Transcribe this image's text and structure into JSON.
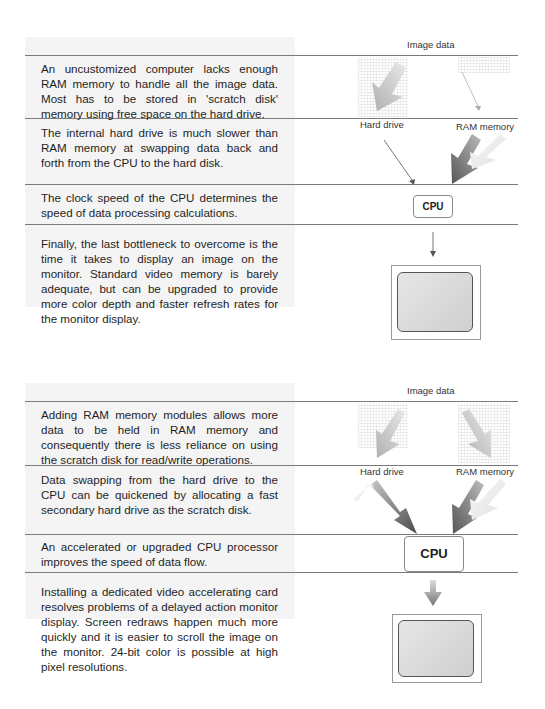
{
  "diagram_top": {
    "labels": {
      "image_data": "Image data",
      "hard_drive": "Hard drive",
      "ram_memory": "RAM memory",
      "cpu": "CPU"
    },
    "paragraphs": [
      "An uncustomized computer lacks enough RAM memory to handle all the image data. Most has to be stored in 'scratch disk' memory using free space on the hard drive.",
      "The internal hard drive is much slower than RAM memory at swapping data back and forth from the CPU to the hard disk.",
      "The clock speed of the CPU determines the speed of data processing calculations.",
      "Finally, the last bottleneck to overcome is the time it takes to display an image on the monitor. Standard video memory is barely adequate, but can be upgraded to provide more color depth and faster refresh rates for the monitor display."
    ]
  },
  "diagram_bottom": {
    "labels": {
      "image_data": "Image data",
      "hard_drive": "Hard drive",
      "ram_memory": "RAM memory",
      "cpu": "CPU"
    },
    "paragraphs": [
      "Adding RAM memory modules allows more data to be held in RAM memory and consequently there is less reliance on using the scratch disk for read/write operations.",
      "Data swapping from the hard drive to the CPU can be quickened by allocating a fast secondary hard drive as the scratch disk.",
      "An accelerated or upgraded CPU processor improves the speed of data flow.",
      "Installing a dedicated video accelerating card resolves problems of a delayed action monitor display. Screen redraws happen much more quickly and it is easier to scroll the image on the monitor. 24-bit color is possible at high pixel resolutions."
    ]
  }
}
